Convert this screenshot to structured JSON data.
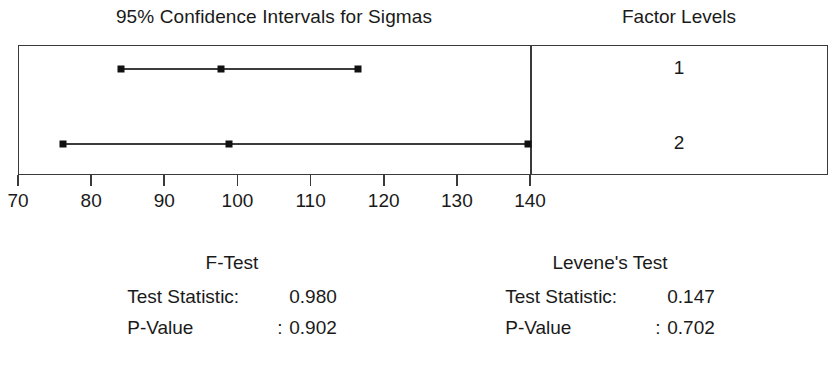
{
  "header": {
    "title": "95% Confidence Intervals for Sigmas",
    "factor_header": "Factor Levels"
  },
  "axis": {
    "ticks": [
      70,
      80,
      90,
      100,
      110,
      120,
      130,
      140
    ],
    "tick_labels": [
      "70",
      "80",
      "90",
      "100",
      "110",
      "120",
      "130",
      "140"
    ],
    "min": 70,
    "max": 140
  },
  "factor_levels": [
    {
      "label": "1"
    },
    {
      "label": "2"
    }
  ],
  "tests": [
    {
      "name": "F-Test",
      "statistic_label": "Test Statistic:",
      "statistic_value": "0.980",
      "pvalue_label": "P-Value",
      "pvalue_sep": ":",
      "pvalue_value": "0.902"
    },
    {
      "name": "Levene's Test",
      "statistic_label": "Test Statistic:",
      "statistic_value": "0.147",
      "pvalue_label": "P-Value",
      "pvalue_sep": ":",
      "pvalue_value": "0.702"
    }
  ],
  "colors": {
    "line": "#3c3c3c",
    "marker": "#111111",
    "frame": "#3a3a3a",
    "text": "#1a1a1a",
    "background": "#ffffff"
  },
  "chart_data": {
    "type": "interval",
    "title": "95% Confidence Intervals for Sigmas",
    "xlabel": "",
    "ylabel": "Factor Levels",
    "xlim": [
      70,
      140
    ],
    "xticks": [
      70,
      80,
      90,
      100,
      110,
      120,
      130,
      140
    ],
    "grid": false,
    "legend": "none",
    "categories": [
      "1",
      "2"
    ],
    "series": [
      {
        "name": "1",
        "lower": 84.1,
        "center": 97.8,
        "upper": 116.5
      },
      {
        "name": "2",
        "lower": 76.1,
        "center": 98.8,
        "upper": 139.7
      }
    ],
    "annotations": [
      "F-Test Test Statistic: 0.980",
      "F-Test P-Value : 0.902",
      "Levene's Test Test Statistic: 0.147",
      "Levene's Test P-Value : 0.702"
    ]
  }
}
